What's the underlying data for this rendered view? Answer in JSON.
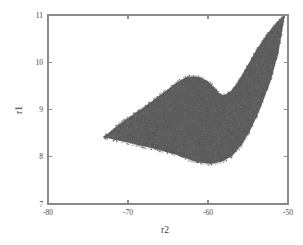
{
  "chart_data": {
    "type": "scatter",
    "title": "",
    "xlabel": "r2",
    "ylabel": "r1",
    "xlim": [
      -80,
      -50
    ],
    "ylim": [
      7,
      11
    ],
    "xticks": [
      -80,
      -70,
      -60,
      -50
    ],
    "xtick_labels": [
      "-80",
      "-70",
      "-60",
      "-50"
    ],
    "yticks": [
      7,
      8,
      9,
      10,
      11
    ],
    "ytick_labels": [
      "7",
      "8",
      "9",
      "10",
      "11"
    ],
    "grid": false,
    "legend": null,
    "marker_color": "#5d5d5d",
    "axis_color": "#8a8a8a",
    "background": "#ffffff",
    "region_outline_upper": [
      [
        -73.0,
        8.42
      ],
      [
        -71.6,
        8.62
      ],
      [
        -70.0,
        8.82
      ],
      [
        -68.4,
        9.0
      ],
      [
        -66.8,
        9.2
      ],
      [
        -65.2,
        9.4
      ],
      [
        -63.8,
        9.58
      ],
      [
        -62.8,
        9.68
      ],
      [
        -62.0,
        9.7
      ],
      [
        -61.0,
        9.68
      ],
      [
        -60.0,
        9.6
      ],
      [
        -59.2,
        9.46
      ],
      [
        -58.6,
        9.34
      ],
      [
        -58.0,
        9.3
      ],
      [
        -57.2,
        9.38
      ],
      [
        -56.2,
        9.6
      ],
      [
        -55.0,
        9.95
      ],
      [
        -53.8,
        10.3
      ],
      [
        -52.6,
        10.6
      ],
      [
        -51.4,
        10.85
      ],
      [
        -50.4,
        11.0
      ]
    ],
    "region_outline_lower": [
      [
        -73.0,
        8.42
      ],
      [
        -71.6,
        8.36
      ],
      [
        -70.0,
        8.3
      ],
      [
        -68.0,
        8.22
      ],
      [
        -66.0,
        8.14
      ],
      [
        -64.0,
        8.04
      ],
      [
        -62.5,
        7.95
      ],
      [
        -61.2,
        7.88
      ],
      [
        -59.6,
        7.85
      ],
      [
        -58.2,
        7.9
      ],
      [
        -57.0,
        8.02
      ],
      [
        -55.8,
        8.25
      ],
      [
        -54.6,
        8.6
      ],
      [
        -53.4,
        9.05
      ],
      [
        -52.2,
        9.6
      ],
      [
        -51.2,
        10.2
      ],
      [
        -50.4,
        11.0
      ]
    ],
    "npoints_estimate": 20000
  },
  "axes": {
    "x_title": "r2",
    "y_title": "r1"
  }
}
